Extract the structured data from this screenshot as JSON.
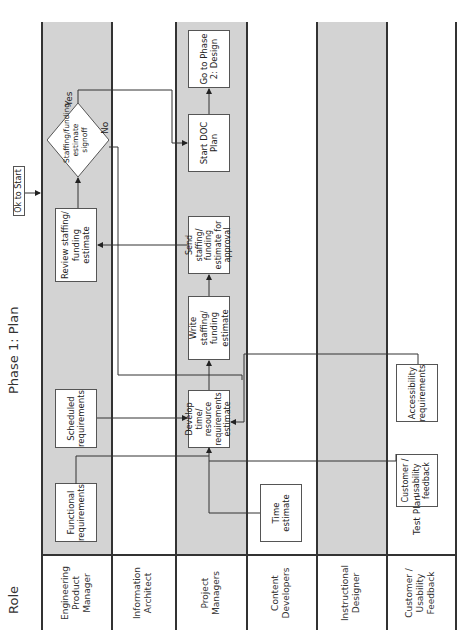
{
  "diagram": {
    "title": "Phase 1: Plan",
    "role_header": "Role",
    "start_label": "Ok to Start",
    "lanes": [
      {
        "id": "epm",
        "label": "Engineering Product Manager",
        "shaded": true
      },
      {
        "id": "ia",
        "label": "Information Architect",
        "shaded": false
      },
      {
        "id": "pm",
        "label": "Project Managers",
        "shaded": true
      },
      {
        "id": "cd",
        "label": "Content Developers",
        "shaded": false
      },
      {
        "id": "id",
        "label": "Instructional Designer",
        "shaded": true
      },
      {
        "id": "cuf",
        "label": "Customer / Usability Feedback",
        "shaded": false
      }
    ],
    "nodes": {
      "functional_requirements": "Functional requirements",
      "scheduled_requirements": "Scheduled requirements",
      "review_estimate": "Review staffing/ funding estimate",
      "decision": "Staffing/funding estimate signoff",
      "develop_estimate": "Develop time/ resource requirements estimate",
      "write_estimate": "Write staffing/ funding estimate",
      "send_estimate": "Send staffing/ funding estimate for approval",
      "start_doc_plan": "Start DOC Plan",
      "go_phase2": "Go to Phase 2: Design",
      "time_estimate": "Time estimate",
      "customer_feedback": "Customer / usability feedback",
      "accessibility_requirements": "Accessibility requirements",
      "test_plan": "Test Plan"
    },
    "decision_labels": {
      "yes": "Yes",
      "no": "No"
    },
    "edges": [
      {
        "from": "Ok to Start",
        "to": "Review staffing/ funding estimate lane"
      },
      {
        "from": "Functional requirements",
        "to": "Develop time/ resource requirements estimate"
      },
      {
        "from": "Scheduled requirements",
        "to": "Develop time/ resource requirements estimate"
      },
      {
        "from": "Time estimate",
        "to": "Develop time/ resource requirements estimate"
      },
      {
        "from": "Customer / usability feedback",
        "to": "Develop time/ resource requirements estimate"
      },
      {
        "from": "Accessibility requirements",
        "to": "Develop time/ resource requirements estimate"
      },
      {
        "from": "Develop time/ resource requirements estimate",
        "to": "Write staffing/ funding estimate"
      },
      {
        "from": "Write staffing/ funding estimate",
        "to": "Send staffing/ funding estimate for approval"
      },
      {
        "from": "Send staffing/ funding estimate for approval",
        "to": "Review staffing/ funding estimate"
      },
      {
        "from": "Review staffing/ funding estimate",
        "to": "Staffing/funding estimate signoff"
      },
      {
        "from": "Staffing/funding estimate signoff",
        "to": "Start DOC Plan",
        "label": "Yes"
      },
      {
        "from": "Staffing/funding estimate signoff",
        "to": "Write staffing/ funding estimate",
        "label": "No"
      },
      {
        "from": "Start DOC Plan",
        "to": "Go to Phase 2: Design"
      }
    ]
  }
}
